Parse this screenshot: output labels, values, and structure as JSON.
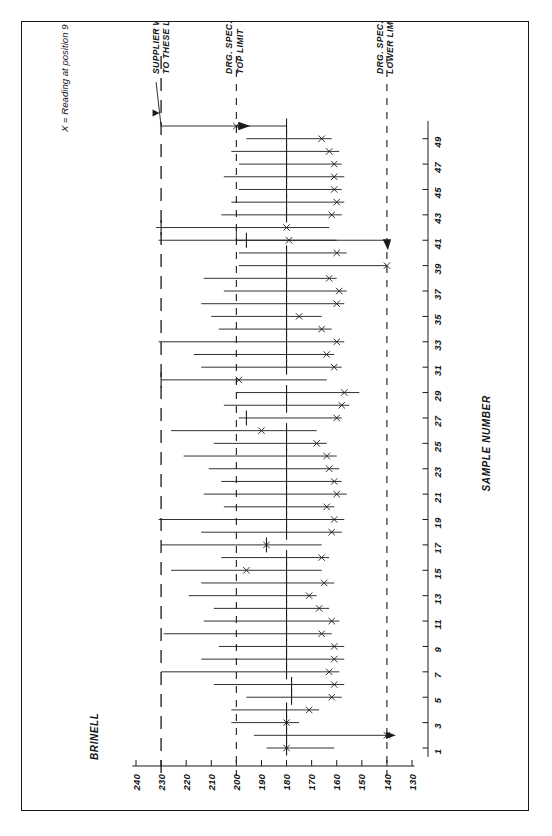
{
  "figure": {
    "note": "X = Reading at position 9",
    "value_axis_title": "BRINELL",
    "sample_axis_title": "SAMPLE NUMBER"
  },
  "annotations": {
    "supplier": "SUPPLIER WORKING\nTO THESE LIMITS",
    "supplier_line1": "SUPPLIER WORKING",
    "supplier_line2": "TO THESE LIMITS",
    "drg_top_line1": "DRG. SPEC.",
    "drg_top_line2": "TOP LIMIT",
    "drg_low_line1": "DRG. SPEC.",
    "drg_low_line2": "LOWER LIMIT"
  },
  "chart_data": {
    "type": "range",
    "xlabel": "SAMPLE NUMBER",
    "ylabel": "BRINELL",
    "value_ticks": [
      240,
      230,
      220,
      210,
      200,
      190,
      180,
      170,
      160,
      150,
      140,
      130
    ],
    "ylim": [
      130,
      245
    ],
    "sample_ticks": [
      1,
      3,
      5,
      7,
      9,
      11,
      13,
      15,
      17,
      19,
      21,
      23,
      25,
      27,
      29,
      31,
      33,
      35,
      37,
      39,
      41,
      43,
      45,
      47,
      49
    ],
    "xlim": [
      1,
      50
    ],
    "grid": false,
    "legend": "X = Reading at position 9",
    "reference_lines": [
      {
        "name": "supplier-upper-limit",
        "value": 230,
        "style": "long-dash",
        "label": "SUPPLIER WORKING TO THESE LIMITS"
      },
      {
        "name": "drg-spec-top-limit",
        "value": 200,
        "style": "dash",
        "label": "DRG. SPEC. TOP LIMIT"
      },
      {
        "name": "drg-spec-lower-limit",
        "value": 140,
        "style": "dash",
        "label": "DRG. SPEC. LOWER LIMIT"
      }
    ],
    "series_note": "Each sample is a horizontal range bar: low..high Brinell, with a centre tick (median) and an X marker for the position-9 reading.",
    "samples": [
      {
        "n": 1,
        "low": 161,
        "high": 188,
        "tick": 180,
        "x": 180
      },
      {
        "n": 2,
        "low": 139,
        "high": 193,
        "tick": 180,
        "x": 140
      },
      {
        "n": 3,
        "low": 175,
        "high": 202,
        "tick": 180,
        "x": 180
      },
      {
        "n": 4,
        "low": 167,
        "high": 202,
        "tick": 180,
        "x": 171
      },
      {
        "n": 5,
        "low": 158,
        "high": 196,
        "tick": 178,
        "x": 162
      },
      {
        "n": 6,
        "low": 157,
        "high": 209,
        "tick": 178,
        "x": 161
      },
      {
        "n": 7,
        "low": 159,
        "high": 230,
        "tick": 180,
        "x": 163
      },
      {
        "n": 8,
        "low": 157,
        "high": 214,
        "tick": 180,
        "x": 161
      },
      {
        "n": 9,
        "low": 157,
        "high": 207,
        "tick": 180,
        "x": 161
      },
      {
        "n": 10,
        "low": 162,
        "high": 229,
        "tick": 180,
        "x": 166
      },
      {
        "n": 11,
        "low": 159,
        "high": 213,
        "tick": 180,
        "x": 162
      },
      {
        "n": 12,
        "low": 163,
        "high": 209,
        "tick": 180,
        "x": 167
      },
      {
        "n": 13,
        "low": 168,
        "high": 219,
        "tick": 180,
        "x": 171
      },
      {
        "n": 14,
        "low": 161,
        "high": 214,
        "tick": 180,
        "x": 165
      },
      {
        "n": 15,
        "low": 166,
        "high": 226,
        "tick": 180,
        "x": 196
      },
      {
        "n": 16,
        "low": 163,
        "high": 206,
        "tick": 180,
        "x": 166
      },
      {
        "n": 17,
        "low": 166,
        "high": 230,
        "tick": 188,
        "x": 188
      },
      {
        "n": 18,
        "low": 158,
        "high": 214,
        "tick": 180,
        "x": 162
      },
      {
        "n": 19,
        "low": 157,
        "high": 231,
        "tick": 180,
        "x": 161
      },
      {
        "n": 20,
        "low": 161,
        "high": 205,
        "tick": 180,
        "x": 164
      },
      {
        "n": 21,
        "low": 156,
        "high": 213,
        "tick": 180,
        "x": 160
      },
      {
        "n": 22,
        "low": 158,
        "high": 206,
        "tick": 180,
        "x": 161
      },
      {
        "n": 23,
        "low": 159,
        "high": 211,
        "tick": 180,
        "x": 163
      },
      {
        "n": 24,
        "low": 160,
        "high": 221,
        "tick": 180,
        "x": 164
      },
      {
        "n": 25,
        "low": 164,
        "high": 209,
        "tick": 180,
        "x": 168
      },
      {
        "n": 26,
        "low": 168,
        "high": 226,
        "tick": 180,
        "x": 190
      },
      {
        "n": 27,
        "low": 158,
        "high": 199,
        "tick": 196,
        "x": 160
      },
      {
        "n": 28,
        "low": 155,
        "high": 205,
        "tick": 180,
        "x": 158
      },
      {
        "n": 29,
        "low": 151,
        "high": 200,
        "tick": 180,
        "x": 157
      },
      {
        "n": 30,
        "low": 164,
        "high": 230,
        "tick": 230,
        "x": 199
      },
      {
        "n": 31,
        "low": 158,
        "high": 214,
        "tick": 180,
        "x": 161
      },
      {
        "n": 32,
        "low": 161,
        "high": 217,
        "tick": 180,
        "x": 164
      },
      {
        "n": 33,
        "low": 157,
        "high": 231,
        "tick": 180,
        "x": 160
      },
      {
        "n": 34,
        "low": 162,
        "high": 207,
        "tick": 180,
        "x": 166
      },
      {
        "n": 35,
        "low": 166,
        "high": 210,
        "tick": 180,
        "x": 175
      },
      {
        "n": 36,
        "low": 157,
        "high": 214,
        "tick": 180,
        "x": 160
      },
      {
        "n": 37,
        "low": 156,
        "high": 205,
        "tick": 180,
        "x": 159
      },
      {
        "n": 38,
        "low": 160,
        "high": 213,
        "tick": 180,
        "x": 163
      },
      {
        "n": 39,
        "low": 140,
        "high": 199,
        "tick": 180,
        "x": 140
      },
      {
        "n": 40,
        "low": 156,
        "high": 199,
        "tick": 180,
        "x": 160
      },
      {
        "n": 41,
        "low": 160,
        "high": 231,
        "tick": 196,
        "x": 179
      },
      {
        "n": 42,
        "low": 163,
        "high": 232,
        "tick": 230,
        "x": 180
      },
      {
        "n": 43,
        "low": 158,
        "high": 206,
        "tick": 180,
        "x": 162
      },
      {
        "n": 44,
        "low": 157,
        "high": 202,
        "tick": 180,
        "x": 160
      },
      {
        "n": 45,
        "low": 158,
        "high": 199,
        "tick": 180,
        "x": 161
      },
      {
        "n": 46,
        "low": 157,
        "high": 205,
        "tick": 180,
        "x": 161
      },
      {
        "n": 47,
        "low": 158,
        "high": 199,
        "tick": 180,
        "x": 161
      },
      {
        "n": 48,
        "low": 159,
        "high": 202,
        "tick": 180,
        "x": 163
      },
      {
        "n": 49,
        "low": 162,
        "high": 196,
        "tick": 180,
        "x": 166
      },
      {
        "n": 50,
        "low": 180,
        "high": 200,
        "tick": 180,
        "x": 200
      }
    ]
  }
}
